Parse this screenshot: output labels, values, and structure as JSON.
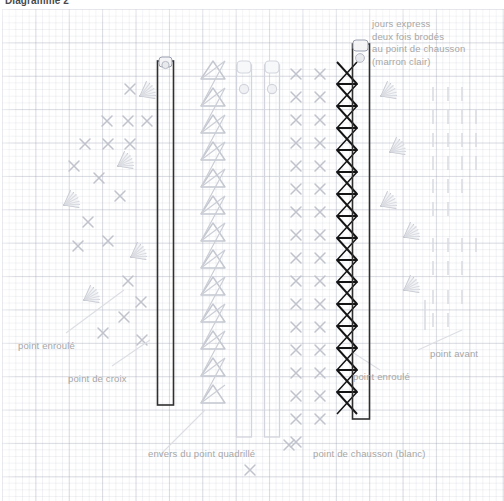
{
  "document": {
    "title": "Diagramme 2",
    "type": "embroidery-stitch-diagram",
    "language": "fr",
    "background": "graph-paper-grid",
    "grid_color": "#c9ccd9",
    "page_color": "#ffffff"
  },
  "callouts": {
    "top_right": {
      "lines": [
        "jours express",
        "deux fois brodés",
        "au point de chausson",
        "(marron clair)"
      ],
      "x": 372,
      "y": 18
    }
  },
  "labels": [
    {
      "id": "point-enroule-left",
      "text": "point enroulé",
      "x": 18,
      "y": 340
    },
    {
      "id": "point-de-croix",
      "text": "point de croix",
      "x": 68,
      "y": 373
    },
    {
      "id": "envers-point-quadrille",
      "text": "envers du point quadrillé",
      "x": 148,
      "y": 448
    },
    {
      "id": "point-de-chausson",
      "text": "point de chausson (blanc)",
      "x": 313,
      "y": 448
    },
    {
      "id": "point-avant",
      "text": "point avant",
      "x": 430,
      "y": 348
    },
    {
      "id": "point-enroule-right",
      "text": "point enroulé",
      "x": 353,
      "y": 371
    }
  ],
  "stitch_columns": [
    {
      "id": "cross-stitch-field",
      "name": "point de croix",
      "kind": "cross",
      "color": "#c3c6cf",
      "x_range": [
        62,
        150
      ]
    },
    {
      "id": "dark-band-left",
      "name": "jour express bande",
      "kind": "band",
      "color": "#3a3a3a",
      "x_range": [
        157,
        175
      ]
    },
    {
      "id": "herringbone-reverse",
      "name": "envers du point quadrillé",
      "kind": "chevron",
      "color": "#c4c7d0",
      "x_range": [
        198,
        228
      ]
    },
    {
      "id": "strip-a",
      "name": "bande claire",
      "kind": "strip",
      "color": "#d6d9e0",
      "x_range": [
        236,
        252
      ]
    },
    {
      "id": "strip-b",
      "name": "bande claire",
      "kind": "strip",
      "color": "#d6d9e0",
      "x_range": [
        264,
        280
      ]
    },
    {
      "id": "cross-stitch-right",
      "name": "point de croix",
      "kind": "cross",
      "color": "#c3c6cf",
      "x_range": [
        288,
        330
      ]
    },
    {
      "id": "herringbone-dark",
      "name": "point de chausson (blanc)",
      "kind": "herringbone",
      "color": "#1f1f1f",
      "x_range": [
        336,
        356
      ]
    },
    {
      "id": "dark-band-right",
      "name": "jour express bande",
      "kind": "band",
      "color": "#3a3a3a",
      "x_range": [
        352,
        370
      ]
    },
    {
      "id": "running-stitch-field",
      "name": "point avant",
      "kind": "dash",
      "color": "#d9dce2",
      "x_range": [
        420,
        490
      ]
    },
    {
      "id": "bullion-fans",
      "name": "point enroulé",
      "kind": "fan",
      "color": "#c8cbd3",
      "x_range": [
        60,
        150
      ]
    }
  ]
}
